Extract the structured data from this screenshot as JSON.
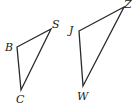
{
  "triangles": [
    {
      "name": "BSC",
      "vertices": [
        {
          "label": "B",
          "x": 17,
          "y": 47,
          "lx": 5,
          "ly": 51
        },
        {
          "label": "S",
          "x": 51,
          "y": 29,
          "lx": 52,
          "ly": 28
        },
        {
          "label": "C",
          "x": 21,
          "y": 90,
          "lx": 16,
          "ly": 103
        }
      ]
    },
    {
      "name": "JZW",
      "vertices": [
        {
          "label": "J",
          "x": 79,
          "y": 31,
          "lx": 69,
          "ly": 34
        },
        {
          "label": "Z",
          "x": 124,
          "y": 7,
          "lx": 124,
          "ly": 8
        },
        {
          "label": "W",
          "x": 83,
          "y": 86,
          "lx": 77,
          "ly": 100
        }
      ]
    }
  ]
}
